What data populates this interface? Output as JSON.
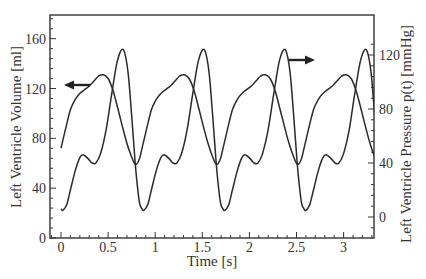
{
  "chart_data": {
    "type": "line",
    "title": "",
    "xlabel": "Time [s]",
    "ylabel_left": "Left Ventricle Volume [ml]",
    "ylabel_right": "Left Ventricle Pressure p(t) [mmHg]",
    "xlim": [
      -0.1,
      3.33
    ],
    "ylim_left": [
      0,
      179
    ],
    "ylim_right": [
      -14,
      134
    ],
    "x_ticks": [
      0,
      0.5,
      1,
      1.5,
      2,
      2.5,
      3
    ],
    "x_tick_labels": [
      "0",
      "0.5",
      "1",
      "1.5",
      "2",
      "2.5",
      "3"
    ],
    "y_left_ticks": [
      0,
      40,
      80,
      120,
      160
    ],
    "y_left_tick_labels": [
      "0",
      "40",
      "80",
      "120",
      "160"
    ],
    "y_right_ticks": [
      0,
      40,
      80,
      120
    ],
    "y_right_tick_labels": [
      "0",
      "40",
      "80",
      "120"
    ],
    "grid": false,
    "legend": "arrows: left-pointing arrow marks the volume curve (left axis), right-pointing arrow marks the pressure curve (right axis)",
    "period_s": 0.86,
    "series": [
      {
        "name": "Left Ventricle Volume",
        "axis": "left",
        "unit": "ml",
        "cycle_t": [
          0.0,
          0.05,
          0.1,
          0.15,
          0.2,
          0.25,
          0.3,
          0.35,
          0.4,
          0.45,
          0.5,
          0.55,
          0.6,
          0.65,
          0.7,
          0.75,
          0.79,
          0.83,
          0.86
        ],
        "cycle_values": [
          72,
          88,
          103,
          111,
          116,
          119,
          122,
          126,
          130,
          131,
          128,
          119,
          105,
          90,
          76,
          65,
          59,
          63,
          72
        ]
      },
      {
        "name": "Left Ventricle Pressure",
        "axis": "right",
        "unit": "mmHg",
        "cycle_t": [
          0.0,
          0.02,
          0.06,
          0.1,
          0.15,
          0.2,
          0.24,
          0.29,
          0.33,
          0.37,
          0.42,
          0.48,
          0.54,
          0.6,
          0.66,
          0.71,
          0.75,
          0.79,
          0.83,
          0.86
        ],
        "cycle_values": [
          6,
          5,
          9,
          20,
          34,
          44,
          46,
          43,
          40,
          40,
          47,
          65,
          92,
          116,
          124,
          108,
          75,
          38,
          12,
          6
        ]
      }
    ],
    "annotations": [
      {
        "type": "arrow",
        "direction": "left",
        "points_to": "left axis",
        "near_series": "Left Ventricle Volume",
        "at_t": 0.3,
        "at_value_left": 124
      },
      {
        "type": "arrow",
        "direction": "right",
        "points_to": "right axis",
        "near_series": "Left Ventricle Pressure",
        "at_t": 2.4,
        "at_value_right": 117
      }
    ]
  },
  "labels": {
    "xlabel": "Time [s]",
    "ylabel_left": "Left Ventricle Volume [ml]",
    "ylabel_right": "Left Ventricle Pressure p(t) [mmHg]"
  }
}
